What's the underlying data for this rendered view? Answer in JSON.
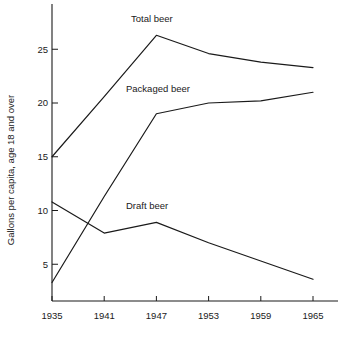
{
  "chart_data": {
    "type": "line",
    "title": "",
    "xlabel": "",
    "ylabel": "Gallons per capita, age 18 and over",
    "x": [
      1935,
      1941,
      1947,
      1953,
      1959,
      1965
    ],
    "categories": [
      "1935",
      "1941",
      "1947",
      "1953",
      "1959",
      "1965"
    ],
    "xlim": [
      1935,
      1965
    ],
    "ylim": [
      0,
      28
    ],
    "y_ticks": [
      5,
      10,
      15,
      20,
      25
    ],
    "y_tick_labels": [
      "5",
      "10",
      "15",
      "20",
      "25"
    ],
    "x_ticks": [
      1935,
      1941,
      1947,
      1953,
      1959,
      1965
    ],
    "x_tick_labels": [
      "1935",
      "1941",
      "1947",
      "1953",
      "1959",
      "1965"
    ],
    "grid": false,
    "legend": "inline-annotations",
    "series": [
      {
        "name": "Total beer",
        "values": [
          15.0,
          20.6,
          26.3,
          24.6,
          23.8,
          23.3
        ],
        "label_x": 1947,
        "label_y": 28.3
      },
      {
        "name": "Packaged beer",
        "values": [
          3.3,
          11.3,
          19.0,
          20.0,
          20.2,
          21.0
        ],
        "label_x": 1947,
        "label_y": 21.8
      },
      {
        "name": "Draft beer",
        "values": [
          10.8,
          7.9,
          8.9,
          7.0,
          5.3,
          3.6
        ],
        "label_x": 1947,
        "label_y": 10.4
      }
    ],
    "colors": {
      "line": "#1a1a1a",
      "axis": "#1a1a1a",
      "text": "#1a1a1a",
      "background": "#ffffff"
    }
  },
  "labels": {
    "y_axis_title": "Gallons per capita, age 18 and over",
    "series_total": "Total beer",
    "series_packaged": "Packaged beer",
    "series_draft": "Draft beer",
    "y_tick_5": "5",
    "y_tick_10": "10",
    "y_tick_15": "15",
    "y_tick_20": "20",
    "y_tick_25": "25",
    "x_tick_1935": "1935",
    "x_tick_1941": "1941",
    "x_tick_1947": "1947",
    "x_tick_1953": "1953",
    "x_tick_1959": "1959",
    "x_tick_1965": "1965"
  }
}
